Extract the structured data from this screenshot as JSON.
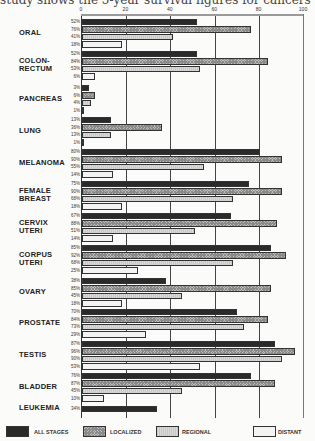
{
  "caption": "study shows the 5-year survival figures for cancers",
  "chart_data": {
    "type": "bar",
    "orientation": "horizontal",
    "title": "5-year survival figures for cancers",
    "xlabel": "",
    "ylabel": "",
    "xlim": [
      0,
      100
    ],
    "x_ticks": [
      "0",
      "20",
      "40",
      "60",
      "80",
      "100"
    ],
    "grid": true,
    "legend_position": "bottom",
    "categories": [
      "ORAL",
      "COLON-RECTUM",
      "PANCREAS",
      "LUNG",
      "MELANOMA",
      "FEMALE BREAST",
      "CERVIX UTERI",
      "CORPUS UTERI",
      "OVARY",
      "PROSTATE",
      "TESTIS",
      "BLADDER",
      "LEUKEMIA"
    ],
    "series": [
      {
        "name": "ALL STAGES",
        "values": [
          52,
          52,
          3,
          13,
          80,
          75,
          67,
          85,
          38,
          70,
          87,
          76,
          34
        ]
      },
      {
        "name": "LOCALIZED",
        "values": [
          76,
          84,
          6,
          36,
          90,
          90,
          88,
          92,
          85,
          84,
          96,
          87,
          null
        ]
      },
      {
        "name": "REGIONAL",
        "values": [
          41,
          53,
          4,
          13,
          55,
          68,
          51,
          68,
          45,
          73,
          90,
          45,
          null
        ]
      },
      {
        "name": "DISTANT",
        "values": [
          18,
          6,
          1,
          1,
          14,
          18,
          14,
          25,
          18,
          29,
          53,
          10,
          null
        ]
      }
    ]
  },
  "groups": [
    {
      "label": "ORAL",
      "rows": [
        {
          "pct": "52%",
          "v": 52
        },
        {
          "pct": "76%",
          "v": 76
        },
        {
          "pct": "41%",
          "v": 41
        },
        {
          "pct": "18%",
          "v": 18
        }
      ]
    },
    {
      "label": "COLON-\nRECTUM",
      "rows": [
        {
          "pct": "52%",
          "v": 52
        },
        {
          "pct": "84%",
          "v": 84
        },
        {
          "pct": "53%",
          "v": 53
        },
        {
          "pct": "6%",
          "v": 6
        }
      ]
    },
    {
      "label": "PANCREAS",
      "rows": [
        {
          "pct": "3%",
          "v": 3
        },
        {
          "pct": "6%",
          "v": 6
        },
        {
          "pct": "4%",
          "v": 4
        },
        {
          "pct": "1%",
          "v": 1
        }
      ]
    },
    {
      "label": "LUNG",
      "rows": [
        {
          "pct": "13%",
          "v": 13
        },
        {
          "pct": "36%",
          "v": 36
        },
        {
          "pct": "13%",
          "v": 13
        },
        {
          "pct": "1%",
          "v": 1
        }
      ]
    },
    {
      "label": "MELANOMA",
      "rows": [
        {
          "pct": "80%",
          "v": 80
        },
        {
          "pct": "90%",
          "v": 90
        },
        {
          "pct": "55%",
          "v": 55
        },
        {
          "pct": "14%",
          "v": 14
        }
      ]
    },
    {
      "label": "FEMALE\nBREAST",
      "rows": [
        {
          "pct": "75%",
          "v": 75
        },
        {
          "pct": "90%",
          "v": 90
        },
        {
          "pct": "68%",
          "v": 68
        },
        {
          "pct": "18%",
          "v": 18
        }
      ]
    },
    {
      "label": "CERVIX\nUTERI",
      "rows": [
        {
          "pct": "67%",
          "v": 67
        },
        {
          "pct": "88%",
          "v": 88
        },
        {
          "pct": "51%",
          "v": 51
        },
        {
          "pct": "14%",
          "v": 14
        }
      ]
    },
    {
      "label": "CORPUS\nUTERI",
      "rows": [
        {
          "pct": "85%",
          "v": 85
        },
        {
          "pct": "92%",
          "v": 92
        },
        {
          "pct": "68%",
          "v": 68
        },
        {
          "pct": "25%",
          "v": 25
        }
      ]
    },
    {
      "label": "OVARY",
      "rows": [
        {
          "pct": "38%",
          "v": 38
        },
        {
          "pct": "85%",
          "v": 85
        },
        {
          "pct": "45%",
          "v": 45
        },
        {
          "pct": "18%",
          "v": 18
        }
      ]
    },
    {
      "label": "PROSTATE",
      "rows": [
        {
          "pct": "70%",
          "v": 70
        },
        {
          "pct": "84%",
          "v": 84
        },
        {
          "pct": "73%",
          "v": 73
        },
        {
          "pct": "29%",
          "v": 29
        }
      ]
    },
    {
      "label": "TESTIS",
      "rows": [
        {
          "pct": "87%",
          "v": 87
        },
        {
          "pct": "96%",
          "v": 96
        },
        {
          "pct": "90%",
          "v": 90
        },
        {
          "pct": "53%",
          "v": 53
        }
      ]
    },
    {
      "label": "BLADDER",
      "rows": [
        {
          "pct": "76%",
          "v": 76
        },
        {
          "pct": "87%",
          "v": 87
        },
        {
          "pct": "45%",
          "v": 45
        },
        {
          "pct": "10%",
          "v": 10
        }
      ]
    },
    {
      "label": "LEUKEMIA",
      "rows": [
        {
          "pct": "34%",
          "v": 34
        }
      ]
    }
  ],
  "axis": {
    "ticks": [
      "0",
      "20",
      "40",
      "60",
      "80",
      "100"
    ]
  },
  "legend": [
    {
      "label": "ALL STAGES",
      "swatch": "s0"
    },
    {
      "label": "LOCALIZED",
      "swatch": "s1"
    },
    {
      "label": "REGIONAL",
      "swatch": "s2"
    },
    {
      "label": "DISTANT",
      "swatch": "s3"
    }
  ]
}
